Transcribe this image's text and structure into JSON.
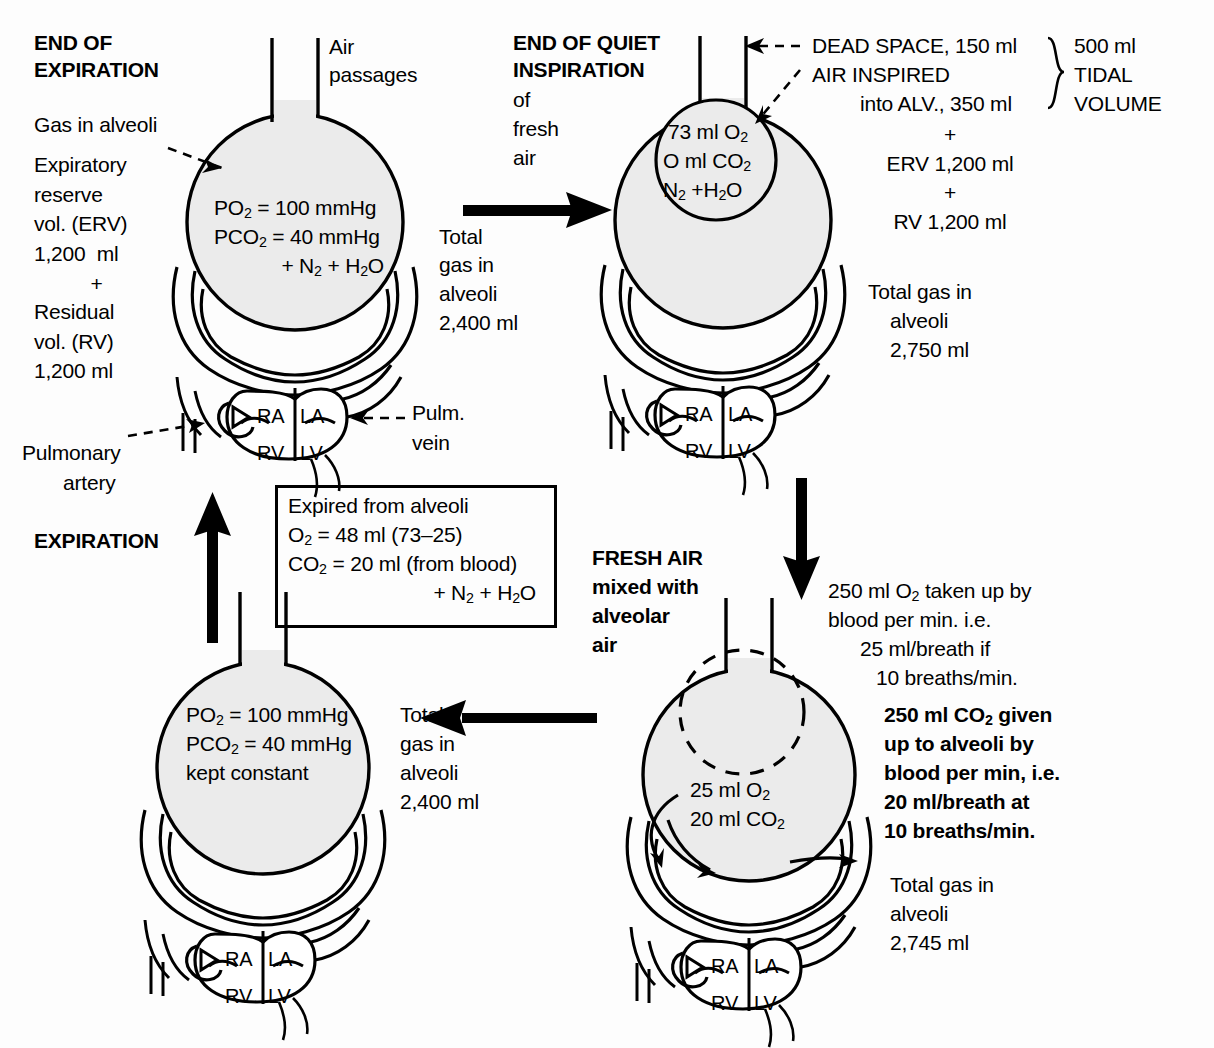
{
  "figure": {
    "colors": {
      "alveolus_fill": "#ebebeb",
      "stroke": "#000000",
      "background": "#fdfdfd"
    }
  },
  "panels": {
    "end_of_expiration": {
      "heading_line1": "END OF",
      "heading_line2": "EXPIRATION",
      "air_passages_label_line1": "Air",
      "air_passages_label_line2": "passages",
      "gas_in_alveoli_label": "Gas in alveoli",
      "left_notes": [
        "Expiratory",
        "reserve",
        "vol. (ERV)",
        "1,200  ml",
        "+",
        "Residual",
        "vol. (RV)",
        "1,200 ml"
      ],
      "alveolus_lines": [
        "PO2 = 100 mmHg",
        "PCO2 = 40 mmHg",
        "+ N2 + H2O"
      ],
      "total_gas": [
        "Total",
        "gas in",
        "alveoli",
        "2,400 ml"
      ],
      "pulmonary_artery_label_line1": "Pulmonary",
      "pulmonary_artery_label_line2": "artery",
      "pulm_vein_label_line1": "Pulm.",
      "pulm_vein_label_line2": "vein",
      "heart_chambers": [
        "RA",
        "LA",
        "RV",
        "LV"
      ]
    },
    "end_of_quiet_inspiration": {
      "heading_line1": "END OF QUIET",
      "heading_line2": "INSPIRATION",
      "subheading": [
        "of",
        "fresh",
        "air"
      ],
      "inner_bubble_lines": [
        "73 ml O2",
        "O ml CO2",
        "N2 +H2O"
      ],
      "dead_space_line": "DEAD SPACE, 150 ml",
      "air_inspired_line1": "AIR INSPIRED",
      "air_inspired_line2": "into ALV., 350 ml",
      "tidal_volume_bracket": [
        "500 ml",
        "TIDAL",
        "VOLUME"
      ],
      "sum_lines": [
        "+",
        "ERV 1,200 ml",
        "+",
        "RV 1,200 ml"
      ],
      "total_gas": [
        "Total gas in",
        "alveoli",
        "2,750 ml"
      ],
      "heart_chambers": [
        "RA",
        "LA",
        "RV",
        "LV"
      ]
    },
    "expiration": {
      "heading": "EXPIRATION",
      "box_lines": [
        "Expired from alveoli",
        "O2 = 48 ml (73–25)",
        "CO2 = 20 ml (from blood)",
        "+ N2 + H2O"
      ],
      "alveolus_lines": [
        "PO2 = 100 mmHg",
        "PCO2 = 40 mmHg",
        "kept constant"
      ],
      "total_gas": [
        "Total",
        "gas in",
        "alveoli",
        "2,400 ml"
      ],
      "heart_chambers": [
        "RA",
        "LA",
        "RV",
        "LV"
      ]
    },
    "fresh_air_mixed": {
      "heading_lines": [
        "FRESH AIR",
        "mixed with",
        "alveolar",
        "air"
      ],
      "exchange_lines": [
        "25 ml O2",
        "20 ml CO2"
      ],
      "right_notes": [
        "250 ml O2 taken up by",
        "blood per min. i.e.",
        "25 ml/breath if",
        "10 breaths/min."
      ],
      "right_notes_2": [
        "250 ml CO2 given",
        "up to alveoli by",
        "blood per min, i.e.",
        "20 ml/breath at",
        "10 breaths/min."
      ],
      "total_gas": [
        "Total gas in",
        "alveoli",
        "2,745 ml"
      ],
      "heart_chambers": [
        "RA",
        "LA",
        "RV",
        "LV"
      ]
    }
  },
  "flow_arrows": [
    {
      "name": "inspiration-arrow",
      "direction": "right"
    },
    {
      "name": "gas-exchange-arrow",
      "direction": "down"
    },
    {
      "name": "mixing-arrow",
      "direction": "left"
    },
    {
      "name": "expiration-arrow",
      "direction": "up"
    }
  ]
}
